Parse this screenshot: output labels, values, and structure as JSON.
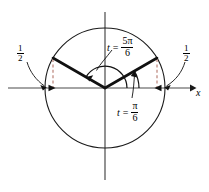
{
  "figure": {
    "type": "unit-circle-diagram",
    "title": "",
    "axes": {
      "x_axis_label": "x",
      "x_axis_arrow": "right",
      "origin": {
        "x": 105,
        "y": 88
      },
      "radius": 60
    },
    "colors": {
      "stroke": "#1a1a1a",
      "axis": "#4a4a4a",
      "dashed_guide": "#c89a92",
      "background": "#ffffff"
    },
    "labels": {
      "angle_upper": {
        "variable": "t",
        "equals": "=",
        "numerator": "5π",
        "denominator": "6",
        "text": "t = 5π/6"
      },
      "angle_lower": {
        "variable": "t",
        "equals": "=",
        "numerator": "π",
        "denominator": "6",
        "text": "t = π/6"
      },
      "value_left": {
        "numerator": "1",
        "denominator": "2",
        "text": "1/2"
      },
      "value_right": {
        "numerator": "1",
        "denominator": "2",
        "text": "1/2"
      }
    },
    "rays": [
      {
        "name": "terminal-side-5pi6",
        "angle_degrees": 150,
        "endpoint": {
          "x": 53,
          "y": 58
        }
      },
      {
        "name": "terminal-side-pi6",
        "angle_degrees": 30,
        "endpoint": {
          "x": 157,
          "y": 58
        }
      }
    ],
    "arcs": [
      {
        "name": "arc-5pi6",
        "from_degrees": 0,
        "to_degrees": 150,
        "radius": 22
      },
      {
        "name": "arc-pi6",
        "from_degrees": 0,
        "to_degrees": 30,
        "radius": 34
      }
    ],
    "guides": [
      {
        "name": "dashed-guide-left",
        "x": 53,
        "from_y": 58,
        "to_y": 88
      },
      {
        "name": "dashed-guide-right",
        "x": 157,
        "from_y": 58,
        "to_y": 88
      }
    ]
  }
}
